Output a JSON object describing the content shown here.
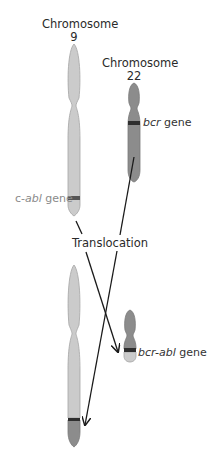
{
  "labels": {
    "chr9_title_line1": "Chromosome",
    "chr9_title_line2": "9",
    "chr22_title_line1": "Chromosome",
    "chr22_title_line2": "22",
    "bcr_gene_italic": "bcr",
    "bcr_gene_suffix": " gene",
    "abl_gene_prefix": "c-",
    "abl_gene_italic": "abl",
    "abl_gene_suffix": " gene",
    "translocation": "Translocation",
    "fusion_gene_italic": "bcr-abl",
    "fusion_gene_suffix": " gene"
  },
  "colors": {
    "chr9_fill": "#cbcbcb",
    "chr22_fill": "#8c8c8c",
    "band": "#2e2e2e",
    "arrow": "#1a1a1a",
    "outline": "#9a9a9a"
  }
}
